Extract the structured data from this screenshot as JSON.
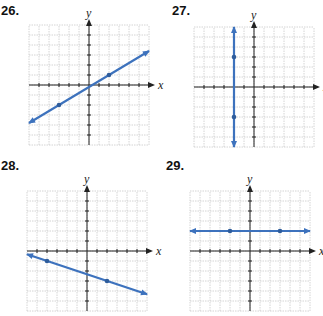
{
  "problems": [
    {
      "number": "26.",
      "xlabel": "x",
      "ylabel": "y"
    },
    {
      "number": "27.",
      "xlabel": "x",
      "ylabel": "y"
    },
    {
      "number": "28.",
      "xlabel": "x",
      "ylabel": "y"
    },
    {
      "number": "29.",
      "xlabel": "x",
      "ylabel": "y"
    }
  ],
  "colors": {
    "line": "#3d72bd",
    "point": "#2f5d9c",
    "grid": "#c9c9c9",
    "axis": "#222222"
  },
  "chart_data": [
    {
      "type": "line",
      "title": "26.",
      "xlabel": "x",
      "ylabel": "y",
      "xlim": [
        -6,
        6
      ],
      "ylim": [
        -6,
        6
      ],
      "grid": true,
      "points": [
        [
          -3,
          -2
        ],
        [
          2,
          1
        ]
      ],
      "line_through": [
        [
          -6,
          -3.8
        ],
        [
          6,
          3.4
        ]
      ]
    },
    {
      "type": "line",
      "title": "27.",
      "xlabel": "x",
      "ylabel": "y",
      "xlim": [
        -6,
        6
      ],
      "ylim": [
        -6,
        6
      ],
      "grid": true,
      "points": [
        [
          -2,
          3
        ],
        [
          -2,
          -3
        ]
      ],
      "line_through": [
        [
          -2,
          6
        ],
        [
          -2,
          -6
        ]
      ],
      "equation": "x = -2"
    },
    {
      "type": "line",
      "title": "28.",
      "xlabel": "x",
      "ylabel": "y",
      "xlim": [
        -6,
        6
      ],
      "ylim": [
        -6,
        6
      ],
      "grid": true,
      "points": [
        [
          -4,
          -1
        ],
        [
          2,
          -3
        ]
      ],
      "line_through": [
        [
          -6,
          -0.33
        ],
        [
          6,
          -4.33
        ]
      ]
    },
    {
      "type": "line",
      "title": "29.",
      "xlabel": "x",
      "ylabel": "y",
      "xlim": [
        -6,
        6
      ],
      "ylim": [
        -6,
        6
      ],
      "grid": true,
      "points": [
        [
          -2,
          2
        ],
        [
          3,
          2
        ]
      ],
      "line_through": [
        [
          -6,
          2
        ],
        [
          6,
          2
        ]
      ],
      "equation": "y = 2"
    }
  ]
}
